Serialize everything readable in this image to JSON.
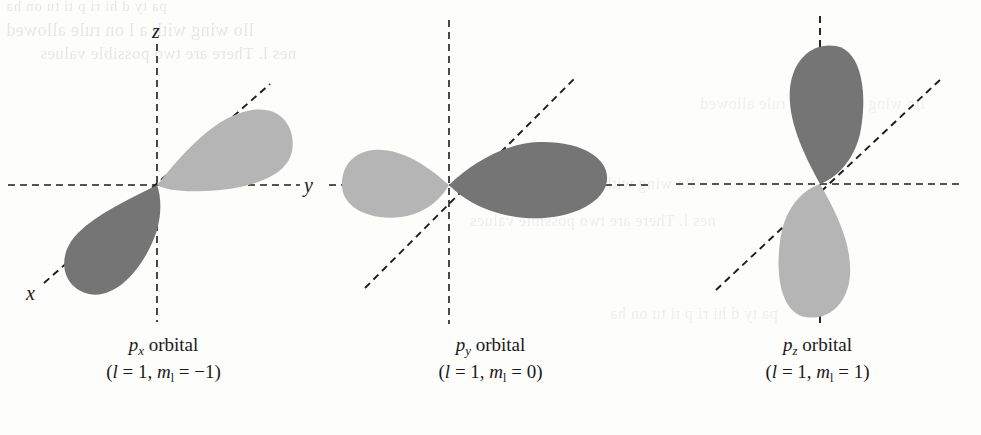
{
  "figure": {
    "background_color": "#fdfdfb",
    "dark_lobe_color": "#757575",
    "light_lobe_color": "#b5b5b5",
    "axis_color": "#1c1c1c"
  },
  "ghost_text": {
    "line1": "pa  ty  d  hi  ri  p  ti  tu  on  ha",
    "line2": "llo  wing  with  a  l  on  rule  allowed",
    "line3": "nes  l.  There  are  two  possible  values"
  },
  "panels": [
    {
      "id": "px",
      "orbital_label": "p",
      "orbital_subscript": "x",
      "orbital_word": "orbital",
      "quantum_l_symbol": "l",
      "quantum_l_value": "1",
      "quantum_m_symbol": "m",
      "quantum_m_subscript": "l",
      "quantum_m_value": "−1",
      "caption_line2_open": "(",
      "caption_line2_close": ")",
      "axes": [
        {
          "name": "z",
          "label": "z",
          "labeled": true,
          "orientation": "vertical"
        },
        {
          "name": "y",
          "label": "y",
          "labeled": true,
          "orientation": "horizontal"
        },
        {
          "name": "x",
          "label": "x",
          "labeled": true,
          "orientation": "diagonal"
        }
      ],
      "lobes": [
        {
          "position": "upper-right",
          "shade": "light"
        },
        {
          "position": "lower-left",
          "shade": "dark"
        }
      ],
      "lobe_axis": "diagonal"
    },
    {
      "id": "py",
      "orbital_label": "p",
      "orbital_subscript": "y",
      "orbital_word": "orbital",
      "quantum_l_symbol": "l",
      "quantum_l_value": "1",
      "quantum_m_symbol": "m",
      "quantum_m_subscript": "l",
      "quantum_m_value": "0",
      "caption_line2_open": "(",
      "caption_line2_close": ")",
      "axes": [
        {
          "name": "z",
          "label": "",
          "labeled": false,
          "orientation": "vertical"
        },
        {
          "name": "y",
          "label": "",
          "labeled": false,
          "orientation": "horizontal"
        },
        {
          "name": "x",
          "label": "",
          "labeled": false,
          "orientation": "diagonal"
        }
      ],
      "lobes": [
        {
          "position": "left",
          "shade": "light"
        },
        {
          "position": "right",
          "shade": "dark"
        }
      ],
      "lobe_axis": "horizontal"
    },
    {
      "id": "pz",
      "orbital_label": "p",
      "orbital_subscript": "z",
      "orbital_word": "orbital",
      "quantum_l_symbol": "l",
      "quantum_l_value": "1",
      "quantum_m_symbol": "m",
      "quantum_m_subscript": "l",
      "quantum_m_value": "1",
      "caption_line2_open": "(",
      "caption_line2_close": ")",
      "axes": [
        {
          "name": "z",
          "label": "",
          "labeled": false,
          "orientation": "vertical"
        },
        {
          "name": "y",
          "label": "",
          "labeled": false,
          "orientation": "horizontal"
        },
        {
          "name": "x",
          "label": "",
          "labeled": false,
          "orientation": "diagonal"
        }
      ],
      "lobes": [
        {
          "position": "top",
          "shade": "dark"
        },
        {
          "position": "bottom",
          "shade": "light"
        }
      ],
      "lobe_axis": "vertical"
    }
  ],
  "symbols": {
    "equals": "=",
    "comma": ","
  }
}
